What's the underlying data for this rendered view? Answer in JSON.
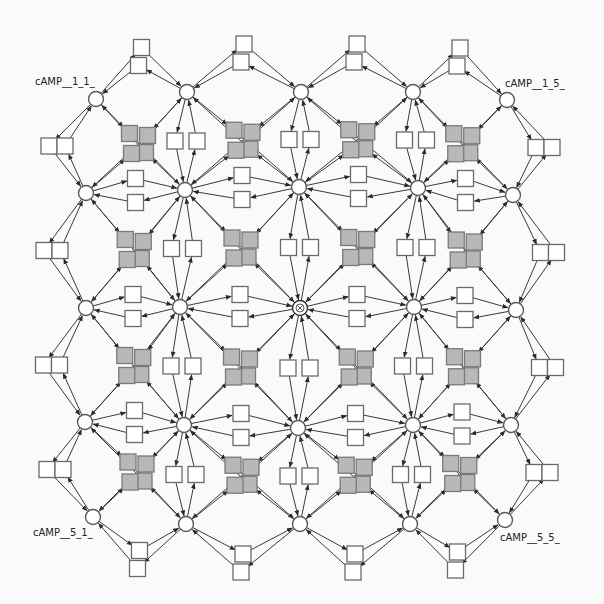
{
  "diagram": {
    "type": "reaction-network",
    "grid": {
      "rows": 5,
      "cols": 5
    },
    "colors": {
      "background": "#fafafa",
      "edge": "#3a3a3a",
      "species_fill": "#ffffff",
      "reaction_white": "#ffffff",
      "reaction_gray": "#b8b8b8"
    },
    "labels": [
      {
        "id": "n_1_1",
        "text": "cAMP__1_1_",
        "x": 35,
        "y": 85
      },
      {
        "id": "n_1_5",
        "text": "cAMP__1_5_",
        "x": 505,
        "y": 87
      },
      {
        "id": "n_5_1",
        "text": "cAMP__5_1_",
        "x": 33,
        "y": 536
      },
      {
        "id": "n_5_5",
        "text": "cAMP__5_5_",
        "x": 500,
        "y": 541
      }
    ],
    "species": [
      {
        "id": "n_1_1",
        "r": 1,
        "c": 1,
        "x": 96,
        "y": 99
      },
      {
        "id": "n_1_2",
        "r": 1,
        "c": 2,
        "x": 187,
        "y": 92
      },
      {
        "id": "n_1_3",
        "r": 1,
        "c": 3,
        "x": 301,
        "y": 92
      },
      {
        "id": "n_1_4",
        "r": 1,
        "c": 4,
        "x": 413,
        "y": 92
      },
      {
        "id": "n_1_5",
        "r": 1,
        "c": 5,
        "x": 507,
        "y": 100
      },
      {
        "id": "n_2_1",
        "r": 2,
        "c": 1,
        "x": 86,
        "y": 193
      },
      {
        "id": "n_2_2",
        "r": 2,
        "c": 2,
        "x": 185,
        "y": 190
      },
      {
        "id": "n_2_3",
        "r": 2,
        "c": 3,
        "x": 299,
        "y": 187
      },
      {
        "id": "n_2_4",
        "r": 2,
        "c": 4,
        "x": 418,
        "y": 188
      },
      {
        "id": "n_2_5",
        "r": 2,
        "c": 5,
        "x": 513,
        "y": 195
      },
      {
        "id": "n_3_1",
        "r": 3,
        "c": 1,
        "x": 86,
        "y": 308
      },
      {
        "id": "n_3_2",
        "r": 3,
        "c": 2,
        "x": 180,
        "y": 307
      },
      {
        "id": "n_3_3",
        "r": 3,
        "c": 3,
        "x": 300,
        "y": 308,
        "selected": true
      },
      {
        "id": "n_3_4",
        "r": 3,
        "c": 4,
        "x": 414,
        "y": 307
      },
      {
        "id": "n_3_5",
        "r": 3,
        "c": 5,
        "x": 516,
        "y": 310
      },
      {
        "id": "n_4_1",
        "r": 4,
        "c": 1,
        "x": 85,
        "y": 422
      },
      {
        "id": "n_4_2",
        "r": 4,
        "c": 2,
        "x": 184,
        "y": 425
      },
      {
        "id": "n_4_3",
        "r": 4,
        "c": 3,
        "x": 298,
        "y": 428
      },
      {
        "id": "n_4_4",
        "r": 4,
        "c": 4,
        "x": 413,
        "y": 425
      },
      {
        "id": "n_4_5",
        "r": 4,
        "c": 5,
        "x": 511,
        "y": 425
      },
      {
        "id": "n_5_1",
        "r": 5,
        "c": 1,
        "x": 93,
        "y": 517
      },
      {
        "id": "n_5_2",
        "r": 5,
        "c": 2,
        "x": 186,
        "y": 524
      },
      {
        "id": "n_5_3",
        "r": 5,
        "c": 3,
        "x": 300,
        "y": 524
      },
      {
        "id": "n_5_4",
        "r": 5,
        "c": 4,
        "x": 410,
        "y": 524
      },
      {
        "id": "n_5_5",
        "r": 5,
        "c": 5,
        "x": 505,
        "y": 520
      }
    ]
  }
}
